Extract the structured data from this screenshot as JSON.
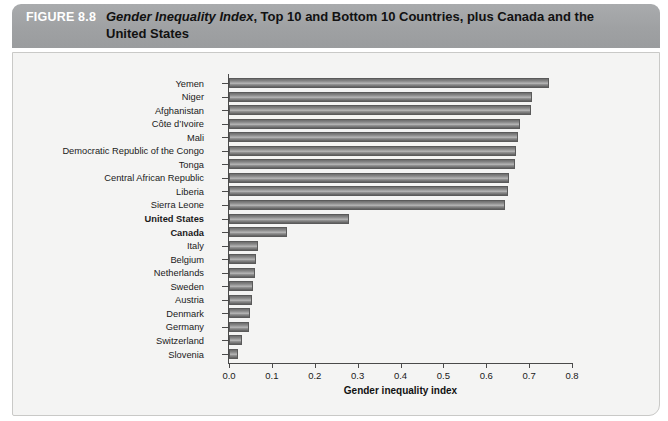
{
  "header": {
    "figure_number": "FIGURE 8.8",
    "title_italic": "Gender Inequality Index",
    "title_rest": ", Top 10 and Bottom 10 Countries, plus Canada and the United States",
    "banner_color": "#9fa1a3",
    "figure_number_color": "#ffffff"
  },
  "panel": {
    "background_color": "#f4f4f3",
    "border_color": "#c9c9c7"
  },
  "chart_data": {
    "type": "bar",
    "orientation": "horizontal",
    "title": "Gender Inequality Index, Top 10 and Bottom 10 Countries, plus Canada and the United States",
    "xlabel": "Gender inequality index",
    "ylabel": "",
    "xlim": [
      0.0,
      0.8
    ],
    "xticks": [
      "0.0",
      "0.1",
      "0.2",
      "0.3",
      "0.4",
      "0.5",
      "0.6",
      "0.7",
      "0.8"
    ],
    "xtick_values": [
      0.0,
      0.1,
      0.2,
      0.3,
      0.4,
      0.5,
      0.6,
      0.7,
      0.8
    ],
    "grid": false,
    "legend": "none",
    "bar_color": "#8c8c8c",
    "categories": [
      "Yemen",
      "Niger",
      "Afghanistan",
      "Côte d’Ivoire",
      "Mali",
      "Democratic Republic of the Congo",
      "Tonga",
      "Central African Republic",
      "Liberia",
      "Sierra Leone",
      "United States",
      "Canada",
      "Italy",
      "Belgium",
      "Netherlands",
      "Sweden",
      "Austria",
      "Denmark",
      "Germany",
      "Switzerland",
      "Slovenia"
    ],
    "values": [
      0.747,
      0.707,
      0.705,
      0.679,
      0.673,
      0.669,
      0.668,
      0.654,
      0.65,
      0.643,
      0.28,
      0.136,
      0.067,
      0.063,
      0.06,
      0.055,
      0.053,
      0.048,
      0.046,
      0.03,
      0.021
    ],
    "highlighted": [
      "United States",
      "Canada"
    ]
  }
}
